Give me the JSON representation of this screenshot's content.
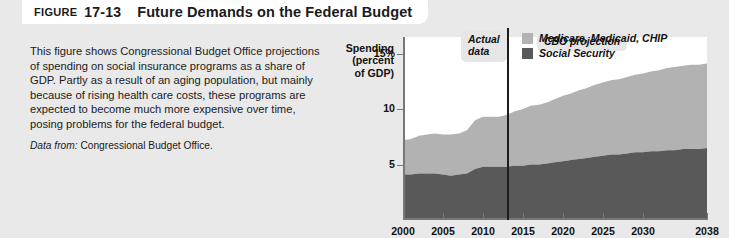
{
  "header": {
    "figure_word": "FIGURE",
    "figure_number": "17-13",
    "title": "Future Demands on the Federal Budget"
  },
  "caption": {
    "body": "This figure shows Congressional Budget Office projections of spending on social insurance programs as a share of GDP. Partly as a result of an aging population, but mainly because of rising health care costs, these programs are expected to become much more expensive over time, posing problems for the federal budget.",
    "source_label": "Data from:",
    "source_value": "Congressional Budget Office."
  },
  "chart_data": {
    "type": "area",
    "title": "Future Demands on the Federal Budget",
    "ylabel": "Spending (percent of GDP)",
    "ylabel_lines": [
      "Spending",
      "(percent",
      "of GDP)"
    ],
    "xlabel": "Year",
    "xlim": [
      2000,
      2038
    ],
    "ylim": [
      0,
      16.5
    ],
    "grid": false,
    "stacked": true,
    "legend_position": "top-right",
    "yticks": [
      5,
      10,
      15
    ],
    "ytick_labels": [
      "5",
      "10",
      "15%"
    ],
    "xticks": [
      2000,
      2005,
      2010,
      2015,
      2020,
      2025,
      2030,
      2038
    ],
    "xtick_labels": [
      "2000",
      "2005",
      "2010",
      "2015",
      "2020",
      "2025",
      "2030",
      "2038"
    ],
    "x": [
      2000,
      2001,
      2002,
      2003,
      2004,
      2005,
      2006,
      2007,
      2008,
      2009,
      2010,
      2011,
      2012,
      2013,
      2014,
      2015,
      2016,
      2017,
      2018,
      2019,
      2020,
      2021,
      2022,
      2023,
      2024,
      2025,
      2026,
      2027,
      2028,
      2029,
      2030,
      2031,
      2032,
      2033,
      2034,
      2035,
      2036,
      2037,
      2038
    ],
    "series": [
      {
        "name": "Social Security",
        "color": "#595959",
        "values": [
          4.1,
          4.1,
          4.2,
          4.2,
          4.2,
          4.1,
          4.0,
          4.1,
          4.2,
          4.6,
          4.8,
          4.8,
          4.8,
          4.8,
          4.9,
          4.9,
          5.0,
          5.0,
          5.1,
          5.2,
          5.3,
          5.4,
          5.5,
          5.6,
          5.7,
          5.8,
          5.9,
          5.9,
          6.0,
          6.1,
          6.1,
          6.2,
          6.2,
          6.3,
          6.3,
          6.4,
          6.4,
          6.4,
          6.5
        ]
      },
      {
        "name": "Medicare, Medicaid, CHIP",
        "color": "#b2b2b2",
        "values": [
          3.1,
          3.2,
          3.4,
          3.5,
          3.6,
          3.6,
          3.7,
          3.7,
          3.9,
          4.4,
          4.5,
          4.5,
          4.5,
          4.7,
          4.9,
          5.1,
          5.3,
          5.4,
          5.5,
          5.7,
          5.9,
          6.0,
          6.2,
          6.3,
          6.5,
          6.6,
          6.7,
          6.8,
          6.9,
          7.0,
          7.1,
          7.2,
          7.3,
          7.4,
          7.5,
          7.5,
          7.6,
          7.6,
          7.6
        ]
      }
    ],
    "legend": [
      {
        "label": "Medicare, Medicaid, CHIP",
        "color": "#b2b2b2"
      },
      {
        "label": "Social Security",
        "color": "#595959"
      }
    ],
    "annotations": [
      {
        "name": "actual-data",
        "text": "Actual\ndata",
        "x": 2011
      },
      {
        "name": "cbo-projection",
        "text": "CBO projection",
        "x": 2016
      }
    ],
    "divider": {
      "name": "projection-divider",
      "x": 2013
    }
  }
}
